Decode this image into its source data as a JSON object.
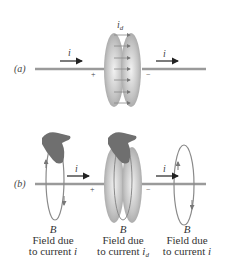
{
  "panel_a": {
    "label": "(a)",
    "current_left": "i",
    "current_right": "i",
    "displacement_current": "i",
    "displacement_current_sub": "d",
    "plus": "+",
    "minus": "−"
  },
  "panel_b": {
    "label": "(b)",
    "current_left": "i",
    "current_right": "i",
    "plus": "+",
    "minus": "−",
    "captions": [
      {
        "field": "B",
        "line1": "Field due",
        "line2": "to current",
        "var": "i",
        "sub": ""
      },
      {
        "field": "B",
        "line1": "Field due",
        "line2": "to current",
        "var": "i",
        "sub": "d"
      },
      {
        "field": "B",
        "line1": "Field due",
        "line2": "to current",
        "var": "i",
        "sub": ""
      }
    ]
  },
  "colors": {
    "wire": "#9a9a9a",
    "plate": "#b8b8b8",
    "hand": "#6f6f6f",
    "field_loop": "#8a8a8a",
    "arrow": "#222222"
  }
}
